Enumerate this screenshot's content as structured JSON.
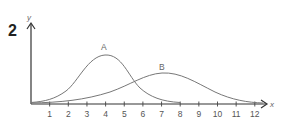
{
  "question_number": "2",
  "chart_data": {
    "type": "line",
    "title": "",
    "xlabel": "x",
    "ylabel": "y",
    "xlim": [
      0,
      12.8
    ],
    "x_ticks": [
      1,
      2,
      3,
      4,
      5,
      6,
      7,
      8,
      9,
      10,
      11,
      12
    ],
    "y_ticks": [],
    "grid": false,
    "legend": "none (curves labelled directly)",
    "series": [
      {
        "name": "A",
        "description": "narrower, taller bell-shaped curve peaking near x=4",
        "peak_x": 4,
        "x": [
          0,
          1,
          2,
          3,
          3.5,
          4,
          4.5,
          5,
          6,
          7,
          8
        ],
        "y_relative": [
          0.04,
          0.1,
          0.28,
          0.68,
          0.9,
          1.0,
          0.93,
          0.74,
          0.34,
          0.1,
          0.03
        ]
      },
      {
        "name": "B",
        "description": "wider, lower bell-shaped curve peaking near x=7",
        "peak_x": 7,
        "x": [
          0,
          1,
          2,
          3,
          4,
          5,
          6,
          7,
          8,
          9,
          10,
          11,
          12,
          12.5
        ],
        "y_relative": [
          0.02,
          0.03,
          0.06,
          0.13,
          0.24,
          0.38,
          0.52,
          0.59,
          0.55,
          0.42,
          0.25,
          0.11,
          0.03,
          0.01
        ]
      }
    ],
    "annotations": [
      {
        "text": "A",
        "x": 4,
        "position": "above peak of curve A"
      },
      {
        "text": "B",
        "x": 7,
        "position": "above peak of curve B"
      }
    ]
  }
}
